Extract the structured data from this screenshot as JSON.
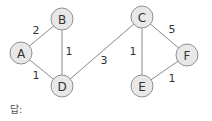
{
  "graph": {
    "nodes": [
      {
        "id": "A",
        "label": "A",
        "x": 21,
        "y": 53
      },
      {
        "id": "B",
        "label": "B",
        "x": 62,
        "y": 19
      },
      {
        "id": "C",
        "label": "C",
        "x": 142,
        "y": 17
      },
      {
        "id": "D",
        "label": "D",
        "x": 62,
        "y": 86
      },
      {
        "id": "E",
        "label": "E",
        "x": 142,
        "y": 86
      },
      {
        "id": "F",
        "label": "F",
        "x": 187,
        "y": 55
      }
    ],
    "edges": [
      {
        "from": "A",
        "to": "B",
        "weight": "2",
        "lx": 36,
        "ly": 34
      },
      {
        "from": "B",
        "to": "D",
        "weight": "1",
        "lx": 69,
        "ly": 55
      },
      {
        "from": "A",
        "to": "D",
        "weight": "1",
        "lx": 36,
        "ly": 79
      },
      {
        "from": "D",
        "to": "C",
        "weight": "3",
        "lx": 104,
        "ly": 64
      },
      {
        "from": "C",
        "to": "E",
        "weight": "1",
        "lx": 133,
        "ly": 55
      },
      {
        "from": "C",
        "to": "F",
        "weight": "5",
        "lx": 172,
        "ly": 33
      },
      {
        "from": "E",
        "to": "F",
        "weight": "1",
        "lx": 172,
        "ly": 82
      }
    ],
    "node_fill": "#e8e8e8",
    "node_stroke": "#909090",
    "edge_color": "#8a8a8a"
  },
  "answer_label": "답:"
}
